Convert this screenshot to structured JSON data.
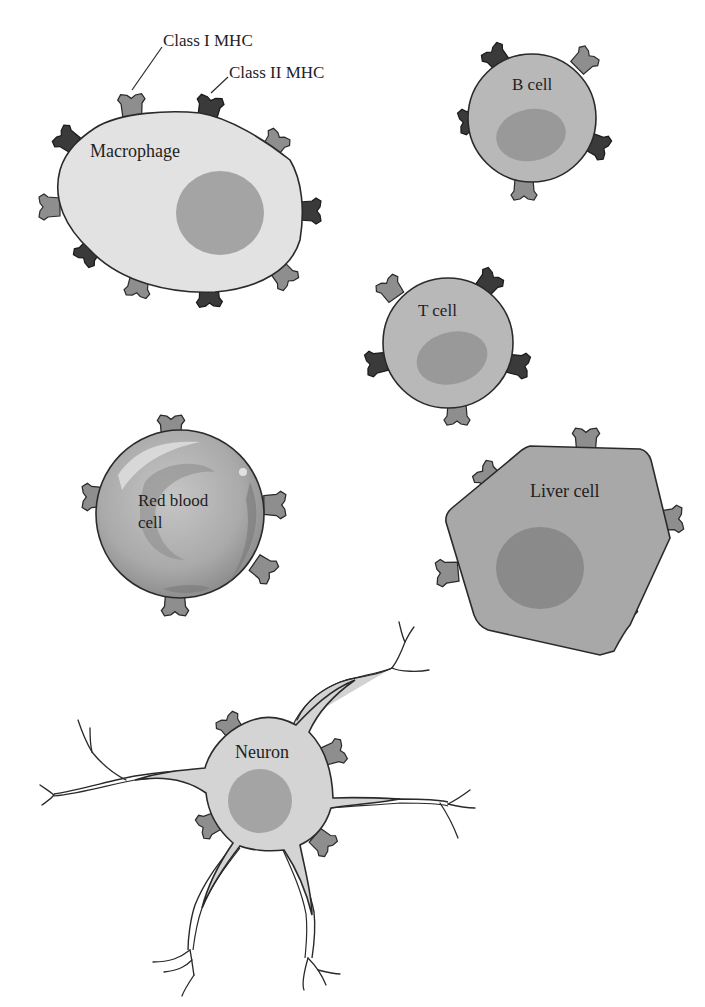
{
  "figure": {
    "legend": {
      "class1_label": "Class I MHC",
      "class2_label": "Class II MHC"
    },
    "colors": {
      "class1_mhc": "#8e8e8e",
      "class2_mhc": "#3a3a3a",
      "pale_cytoplasm": "#e2e2e2",
      "medium_cytoplasm": "#b4b4b4",
      "liver_cytoplasm": "#a6a6a6",
      "nucleus": "#9a9a9a",
      "outline": "#2a2a2a"
    },
    "cells": [
      {
        "id": "macrophage",
        "label": "Macrophage",
        "class1": true,
        "class2": true
      },
      {
        "id": "b-cell",
        "label": "B cell",
        "class1": true,
        "class2": true
      },
      {
        "id": "t-cell",
        "label": "T cell",
        "class1": true,
        "class2": true
      },
      {
        "id": "red-blood-cell",
        "label_line1": "Red blood",
        "label_line2": "cell",
        "class1": true,
        "class2": false
      },
      {
        "id": "liver-cell",
        "label": "Liver cell",
        "class1": true,
        "class2": false
      },
      {
        "id": "neuron",
        "label": "Neuron",
        "class1": true,
        "class2": false
      }
    ]
  }
}
